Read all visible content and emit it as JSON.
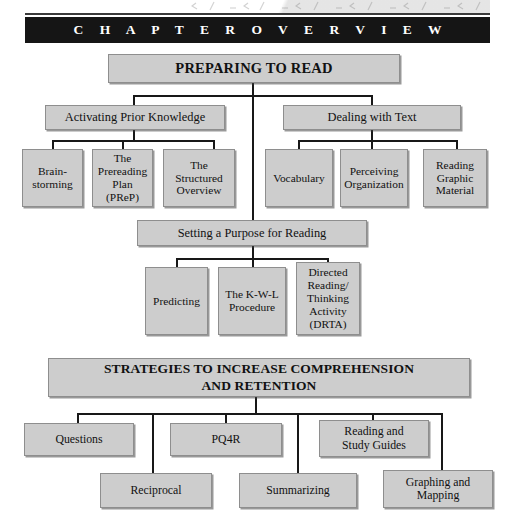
{
  "header": {
    "chapter_overview_label": "C H A P T E R   O V E R V I E W"
  },
  "diagram": {
    "type": "hierarchy-flowchart",
    "root": {
      "label": "PREPARING TO READ"
    },
    "branches": [
      {
        "label": "Activating Prior Knowledge",
        "children": [
          {
            "label": "Brain-\nstorming"
          },
          {
            "label": "The\nPrereading\nPlan\n(PReP)"
          },
          {
            "label": "The\nStructured\nOverview"
          }
        ]
      },
      {
        "label": "Dealing with Text",
        "children": [
          {
            "label": "Vocabulary"
          },
          {
            "label": "Perceiving\nOrganization"
          },
          {
            "label": "Reading\nGraphic\nMaterial"
          }
        ]
      }
    ],
    "purpose": {
      "label": "Setting a Purpose for Reading",
      "children": [
        {
          "label": "Predicting"
        },
        {
          "label": "The K-W-L\nProcedure"
        },
        {
          "label": "Directed\nReading/\nThinking\nActivity\n(DRTA)"
        }
      ]
    },
    "strategies": {
      "label": "STRATEGIES TO INCREASE COMPREHENSION\nAND RETENTION",
      "children": [
        {
          "label": "Questions"
        },
        {
          "label": "Reciprocal"
        },
        {
          "label": "PQ4R"
        },
        {
          "label": "Summarizing"
        },
        {
          "label": "Reading and\nStudy Guides"
        },
        {
          "label": "Graphing and\nMapping"
        }
      ]
    }
  },
  "colors": {
    "box_fill": "#cdcdcd",
    "box_border": "#8e8e8e",
    "line": "#181818",
    "bar_bg": "#151515",
    "bar_text": "#ffffff"
  }
}
